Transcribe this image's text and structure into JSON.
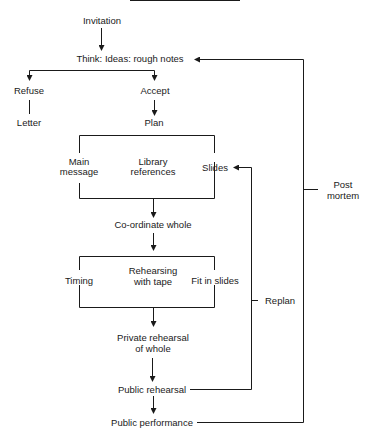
{
  "diagram": {
    "type": "flowchart",
    "title": "",
    "nodes": {
      "invitation": "Invitation",
      "think": "Think:  Ideas:  rough notes",
      "refuse": "Refuse",
      "accept": "Accept",
      "letter": "Letter",
      "plan": "Plan",
      "main_message_1": "Main",
      "main_message_2": "message",
      "library_1": "Library",
      "library_2": "references",
      "slides": "Slides",
      "coordinate": "Co-ordinate whole",
      "timing": "Timing",
      "rehearsing_1": "Rehearsing",
      "rehearsing_2": "with tape",
      "fit_slides": "Fit in slides",
      "private_1": "Private rehearsal",
      "private_2": "of whole",
      "public_rehearsal": "Public rehearsal",
      "public_performance": "Public performance",
      "replan": "Replan",
      "post_1": "Post",
      "post_2": "mortem"
    },
    "edges": [
      {
        "from": "Invitation",
        "to": "Think: Ideas: rough notes"
      },
      {
        "from": "Think: Ideas: rough notes",
        "to": "Refuse"
      },
      {
        "from": "Think: Ideas: rough notes",
        "to": "Accept"
      },
      {
        "from": "Refuse",
        "to": "Letter"
      },
      {
        "from": "Accept",
        "to": "Plan"
      },
      {
        "from": "Plan",
        "to": [
          "Main message",
          "Library references",
          "Slides"
        ]
      },
      {
        "from": [
          "Main message",
          "Library references",
          "Slides"
        ],
        "to": "Co-ordinate whole"
      },
      {
        "from": "Co-ordinate whole",
        "to": [
          "Timing",
          "Rehearsing with tape",
          "Fit in slides"
        ]
      },
      {
        "from": [
          "Timing",
          "Rehearsing with tape",
          "Fit in slides"
        ],
        "to": "Private rehearsal of whole"
      },
      {
        "from": "Private rehearsal of whole",
        "to": "Public rehearsal"
      },
      {
        "from": "Public rehearsal",
        "to": "Public performance"
      },
      {
        "from": "Public rehearsal",
        "to": "Slides",
        "label": "Replan"
      },
      {
        "from": "Public performance",
        "to": "Think: Ideas: rough notes",
        "label": "Post mortem"
      }
    ]
  }
}
